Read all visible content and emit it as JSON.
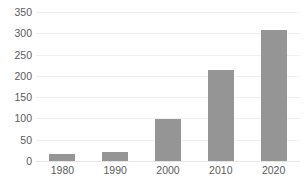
{
  "chart_data": {
    "type": "bar",
    "title": "",
    "subtitle": "",
    "xlabel": "",
    "ylabel": "",
    "categories": [
      "1980",
      "1990",
      "2000",
      "2010",
      "2020"
    ],
    "values": [
      16,
      22,
      98,
      214,
      307
    ],
    "series": [
      {
        "name": "",
        "values": [
          16,
          22,
          98,
          214,
          307
        ]
      }
    ],
    "ylim": [
      0,
      350
    ],
    "ytick_labels": [
      "0",
      "50",
      "100",
      "150",
      "200",
      "250",
      "300",
      "350"
    ],
    "ytick_values": [
      0,
      50,
      100,
      150,
      200,
      250,
      300,
      350
    ],
    "grid": true,
    "grid_axis": "y",
    "legend": false,
    "legend_position": "none",
    "bar_color": "#959595",
    "background_color": "#ffffff",
    "gridline_color": "#f0f0f0",
    "tick_label_color": "#5b5b5b"
  },
  "figure": {
    "title_fragment": ""
  }
}
